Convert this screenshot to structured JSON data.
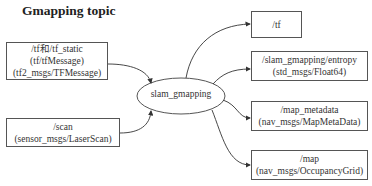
{
  "title": "Gmapping topic",
  "center_node": {
    "label": "slam_gmapping"
  },
  "inputs": [
    {
      "lines": [
        "/tf和/tf_static",
        "(tf/tfMessage)",
        "(tf2_msgs/TFMessage)"
      ]
    },
    {
      "lines": [
        "/scan",
        "(sensor_msgs/LaserScan)"
      ]
    }
  ],
  "outputs": [
    {
      "lines": [
        "/tf"
      ]
    },
    {
      "lines": [
        "/slam_gmapping/entropy",
        "(std_msgs/Float64)"
      ]
    },
    {
      "lines": [
        "/map_metadata",
        "(nav_msgs/MapMetaData)"
      ]
    },
    {
      "lines": [
        "/map",
        "(nav_msgs/OccupancyGrid)"
      ]
    }
  ],
  "colors": {
    "stroke": "#555555",
    "text": "#333333",
    "background": "#ffffff"
  }
}
